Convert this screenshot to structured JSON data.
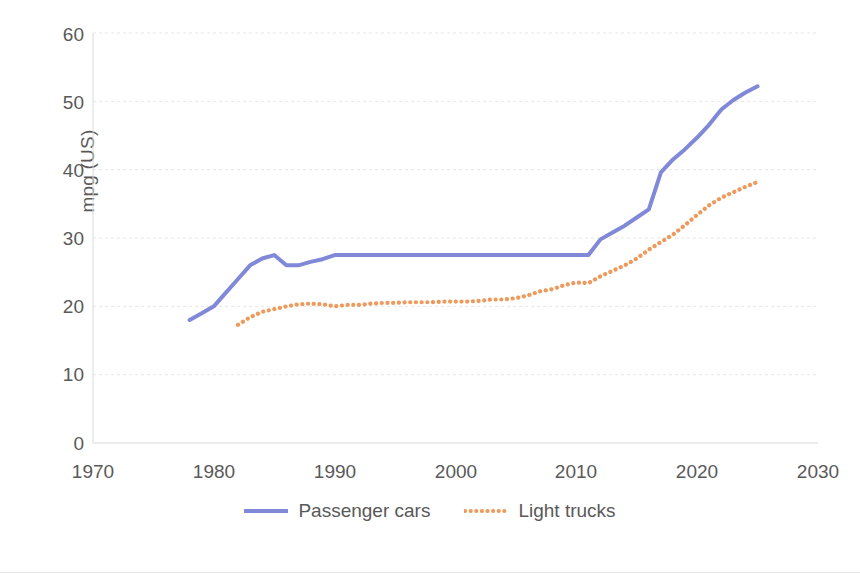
{
  "chart_data": {
    "type": "line",
    "title": "",
    "xlabel": "",
    "ylabel": "mpg (US)",
    "xlim": [
      1970,
      2030
    ],
    "ylim": [
      0,
      60
    ],
    "xticks": [
      1970,
      1980,
      1990,
      2000,
      2010,
      2020,
      2030
    ],
    "yticks": [
      0,
      10,
      20,
      30,
      40,
      50,
      60
    ],
    "grid": "horizontal",
    "legend_position": "bottom",
    "colors": {
      "passenger_cars": "#8089D8",
      "light_trucks": "#ED9A5C",
      "axis_text": "#595959",
      "gridline": "#E6E6E6",
      "background": "#FFFFFF"
    },
    "series": [
      {
        "name": "Passenger cars",
        "style": "solid",
        "color": "#8089D8",
        "x": [
          1978,
          1979,
          1980,
          1981,
          1982,
          1983,
          1984,
          1985,
          1986,
          1987,
          1988,
          1989,
          1990,
          1991,
          1992,
          1993,
          1994,
          1995,
          1996,
          1997,
          1998,
          1999,
          2000,
          2001,
          2002,
          2003,
          2004,
          2005,
          2006,
          2007,
          2008,
          2009,
          2010,
          2011,
          2012,
          2013,
          2014,
          2015,
          2016,
          2017,
          2018,
          2019,
          2020,
          2021,
          2022,
          2023,
          2024,
          2025
        ],
        "values": [
          18.0,
          19.0,
          20.0,
          22.0,
          24.0,
          26.0,
          27.0,
          27.5,
          26.0,
          26.0,
          26.5,
          26.9,
          27.5,
          27.5,
          27.5,
          27.5,
          27.5,
          27.5,
          27.5,
          27.5,
          27.5,
          27.5,
          27.5,
          27.5,
          27.5,
          27.5,
          27.5,
          27.5,
          27.5,
          27.5,
          27.5,
          27.5,
          27.5,
          27.5,
          29.8,
          30.8,
          31.8,
          33.0,
          34.2,
          39.6,
          41.5,
          43.0,
          44.7,
          46.6,
          48.8,
          50.2,
          51.3,
          52.2
        ]
      },
      {
        "name": "Light trucks",
        "style": "dotted",
        "color": "#ED9A5C",
        "x": [
          1982,
          1983,
          1984,
          1985,
          1986,
          1987,
          1988,
          1989,
          1990,
          1991,
          1992,
          1993,
          1994,
          1995,
          1996,
          1997,
          1998,
          1999,
          2000,
          2001,
          2002,
          2003,
          2004,
          2005,
          2006,
          2007,
          2008,
          2009,
          2010,
          2011,
          2012,
          2013,
          2014,
          2015,
          2016,
          2017,
          2018,
          2019,
          2020,
          2021,
          2022,
          2023,
          2024,
          2025
        ],
        "values": [
          17.3,
          18.4,
          19.2,
          19.6,
          20.0,
          20.3,
          20.4,
          20.3,
          20.0,
          20.2,
          20.2,
          20.4,
          20.5,
          20.5,
          20.6,
          20.6,
          20.6,
          20.7,
          20.7,
          20.7,
          20.8,
          21.0,
          21.0,
          21.2,
          21.6,
          22.2,
          22.5,
          23.1,
          23.5,
          23.4,
          24.4,
          25.2,
          26.0,
          27.0,
          28.3,
          29.4,
          30.5,
          31.9,
          33.4,
          34.8,
          35.9,
          36.7,
          37.5,
          38.2
        ]
      }
    ]
  },
  "legend": {
    "items": [
      {
        "label": "Passenger cars"
      },
      {
        "label": "Light trucks"
      }
    ]
  },
  "axes": {
    "y_label": "mpg (US)",
    "y_ticks": [
      "60",
      "50",
      "40",
      "30",
      "20",
      "10",
      "0"
    ],
    "x_ticks": [
      "1970",
      "1980",
      "1990",
      "2000",
      "2010",
      "2020",
      "2030"
    ]
  }
}
